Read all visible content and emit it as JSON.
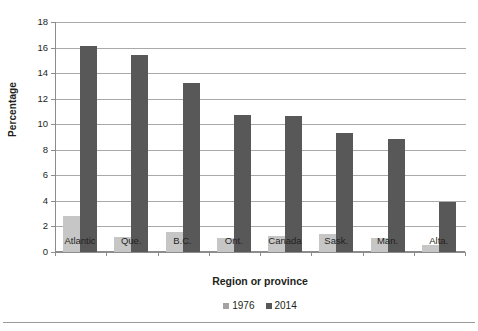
{
  "chart_data": {
    "type": "bar",
    "title": "",
    "subtitle": "",
    "xlabel": "Region or province",
    "ylabel": "Percentage",
    "categories": [
      "Atlantic",
      "Que.",
      "B.C.",
      "Ont.",
      "Canada",
      "Sask.",
      "Man.",
      "Alta."
    ],
    "series": [
      {
        "name": "1976",
        "color": "#c6c6c6",
        "values": [
          2.8,
          1.15,
          1.6,
          1.1,
          1.25,
          1.4,
          1.1,
          0.55
        ]
      },
      {
        "name": "2014",
        "color": "#585858",
        "values": [
          16.1,
          15.4,
          13.2,
          10.7,
          10.65,
          9.35,
          8.85,
          3.9
        ]
      }
    ],
    "ylim": [
      0,
      18
    ],
    "ytick_step": 2,
    "yticks": [
      0,
      2,
      4,
      6,
      8,
      10,
      12,
      14,
      16,
      18
    ],
    "ytick_labels": [
      "0",
      "2",
      "4",
      "6",
      "8",
      "10",
      "12",
      "14",
      "16",
      "18"
    ],
    "grid": "horizontal",
    "legend_position": "bottom-center",
    "legend_entries": [
      "1976",
      "2014"
    ]
  },
  "axes": {
    "y_title": "Percentage",
    "x_title": "Region or province"
  },
  "colors": {
    "series_1976": "#c6c6c6",
    "series_2014": "#585858",
    "legend_swatch_1976": "#a3a3a3",
    "gridline": "#a9a9a9",
    "axis": "#8c8c8c",
    "text": "#231f20",
    "background": "#ffffff"
  }
}
